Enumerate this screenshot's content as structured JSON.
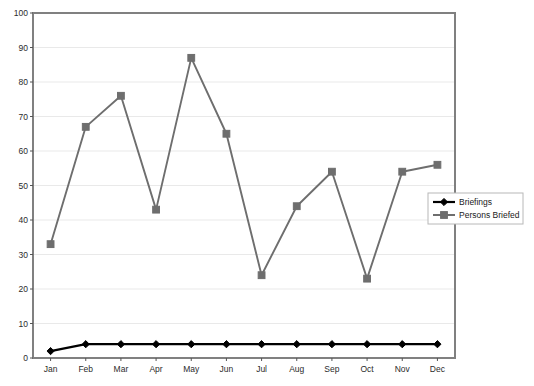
{
  "chart_data": {
    "type": "line",
    "title": "",
    "subtitle": "",
    "xlabel": "",
    "ylabel": "",
    "categories": [
      "Jan",
      "Feb",
      "Mar",
      "Apr",
      "May",
      "Jun",
      "Jul",
      "Aug",
      "Sep",
      "Oct",
      "Nov",
      "Dec"
    ],
    "series": [
      {
        "name": "Briefings",
        "color": "#000000",
        "marker": "diamond",
        "values": [
          2,
          4,
          4,
          4,
          4,
          4,
          4,
          4,
          4,
          4,
          4,
          4
        ]
      },
      {
        "name": "Persons Briefed",
        "color": "#6e6e6e",
        "marker": "square",
        "values": [
          33,
          67,
          76,
          43,
          87,
          65,
          24,
          44,
          54,
          23,
          54,
          56
        ]
      }
    ],
    "ylim": [
      0,
      100
    ],
    "ytick_step": 10,
    "yticks": [
      "0",
      "10",
      "20",
      "30",
      "40",
      "50",
      "60",
      "70",
      "80",
      "90",
      "100"
    ],
    "grid": true,
    "grid_axis": "y",
    "legend_position": "right-middle",
    "legend_entries": [
      "Briefings",
      "Persons Briefed"
    ]
  }
}
